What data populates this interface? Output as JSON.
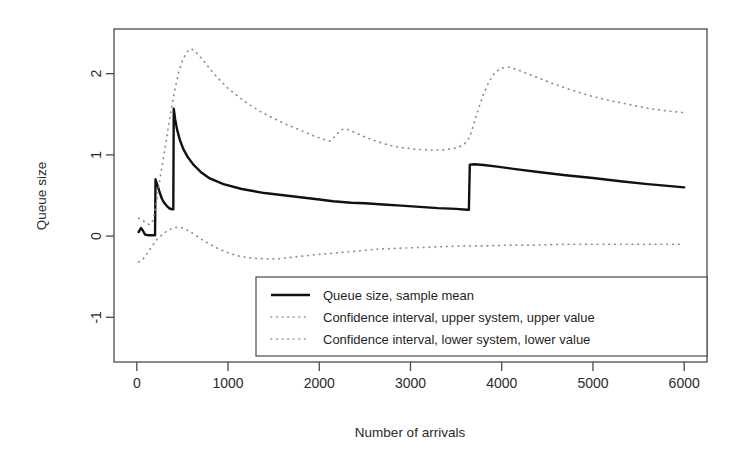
{
  "chart_data": {
    "type": "line",
    "title": "",
    "xlabel": "Number of arrivals",
    "ylabel": "Queue size",
    "xlim": [
      -250,
      6250
    ],
    "ylim": [
      -1.55,
      2.55
    ],
    "xticks": [
      0,
      1000,
      2000,
      3000,
      4000,
      5000,
      6000
    ],
    "xticklabels": [
      "0",
      "1000",
      "2000",
      "3000",
      "4000",
      "5000",
      "6000"
    ],
    "yticks": [
      -1,
      0,
      1,
      2
    ],
    "yticklabels": [
      "-1",
      "0",
      "1",
      "2"
    ],
    "grid": false,
    "legend_position": "bottom-center",
    "series": [
      {
        "name": "Queue size, sample mean",
        "style": "solid",
        "color": "#111111",
        "points": [
          [
            20,
            0.05
          ],
          [
            45,
            0.1
          ],
          [
            60,
            0.08
          ],
          [
            90,
            0.02
          ],
          [
            130,
            0.01
          ],
          [
            180,
            0.01
          ],
          [
            200,
            0.01
          ],
          [
            205,
            0.7
          ],
          [
            225,
            0.63
          ],
          [
            250,
            0.54
          ],
          [
            275,
            0.46
          ],
          [
            300,
            0.41
          ],
          [
            330,
            0.37
          ],
          [
            360,
            0.34
          ],
          [
            390,
            0.33
          ],
          [
            400,
            0.33
          ],
          [
            405,
            1.57
          ],
          [
            420,
            1.44
          ],
          [
            440,
            1.32
          ],
          [
            470,
            1.19
          ],
          [
            510,
            1.07
          ],
          [
            560,
            0.97
          ],
          [
            620,
            0.88
          ],
          [
            700,
            0.79
          ],
          [
            800,
            0.71
          ],
          [
            950,
            0.64
          ],
          [
            1150,
            0.58
          ],
          [
            1400,
            0.53
          ],
          [
            1700,
            0.49
          ],
          [
            2000,
            0.45
          ],
          [
            2150,
            0.43
          ],
          [
            2250,
            0.42
          ],
          [
            2350,
            0.41
          ],
          [
            2500,
            0.405
          ],
          [
            2700,
            0.39
          ],
          [
            2900,
            0.375
          ],
          [
            3100,
            0.36
          ],
          [
            3300,
            0.345
          ],
          [
            3500,
            0.335
          ],
          [
            3620,
            0.325
          ],
          [
            3640,
            0.325
          ],
          [
            3650,
            0.88
          ],
          [
            3700,
            0.885
          ],
          [
            3800,
            0.875
          ],
          [
            3950,
            0.855
          ],
          [
            4150,
            0.825
          ],
          [
            4400,
            0.79
          ],
          [
            4700,
            0.75
          ],
          [
            5000,
            0.715
          ],
          [
            5300,
            0.675
          ],
          [
            5600,
            0.64
          ],
          [
            5850,
            0.615
          ],
          [
            6000,
            0.6
          ]
        ]
      },
      {
        "name": "Confidence interval, upper system, upper value",
        "style": "dotted",
        "color": "#8d8d8d",
        "points": [
          [
            20,
            0.22
          ],
          [
            60,
            0.2
          ],
          [
            100,
            0.16
          ],
          [
            140,
            0.14
          ],
          [
            180,
            0.2
          ],
          [
            220,
            0.45
          ],
          [
            260,
            0.75
          ],
          [
            300,
            1.02
          ],
          [
            340,
            1.3
          ],
          [
            380,
            1.58
          ],
          [
            420,
            1.82
          ],
          [
            460,
            2.02
          ],
          [
            500,
            2.16
          ],
          [
            540,
            2.25
          ],
          [
            575,
            2.3
          ],
          [
            610,
            2.3
          ],
          [
            650,
            2.26
          ],
          [
            700,
            2.2
          ],
          [
            760,
            2.12
          ],
          [
            830,
            2.02
          ],
          [
            910,
            1.92
          ],
          [
            1000,
            1.82
          ],
          [
            1110,
            1.72
          ],
          [
            1230,
            1.62
          ],
          [
            1360,
            1.53
          ],
          [
            1500,
            1.45
          ],
          [
            1650,
            1.37
          ],
          [
            1800,
            1.3
          ],
          [
            1950,
            1.23
          ],
          [
            2050,
            1.19
          ],
          [
            2120,
            1.17
          ],
          [
            2180,
            1.24
          ],
          [
            2230,
            1.3
          ],
          [
            2270,
            1.32
          ],
          [
            2320,
            1.31
          ],
          [
            2400,
            1.27
          ],
          [
            2500,
            1.22
          ],
          [
            2620,
            1.17
          ],
          [
            2760,
            1.12
          ],
          [
            2900,
            1.09
          ],
          [
            3050,
            1.07
          ],
          [
            3200,
            1.06
          ],
          [
            3350,
            1.06
          ],
          [
            3480,
            1.08
          ],
          [
            3580,
            1.12
          ],
          [
            3650,
            1.22
          ],
          [
            3720,
            1.48
          ],
          [
            3790,
            1.72
          ],
          [
            3860,
            1.9
          ],
          [
            3930,
            2.02
          ],
          [
            4000,
            2.07
          ],
          [
            4080,
            2.08
          ],
          [
            4170,
            2.05
          ],
          [
            4280,
            2.0
          ],
          [
            4420,
            1.94
          ],
          [
            4580,
            1.87
          ],
          [
            4760,
            1.8
          ],
          [
            4960,
            1.73
          ],
          [
            5180,
            1.67
          ],
          [
            5400,
            1.62
          ],
          [
            5620,
            1.57
          ],
          [
            5820,
            1.54
          ],
          [
            6000,
            1.52
          ]
        ]
      },
      {
        "name": "Confidence interval, lower system, lower value",
        "style": "dotted",
        "color": "#8d8d8d",
        "points": [
          [
            20,
            -0.32
          ],
          [
            70,
            -0.28
          ],
          [
            120,
            -0.2
          ],
          [
            170,
            -0.12
          ],
          [
            220,
            -0.04
          ],
          [
            280,
            0.02
          ],
          [
            340,
            0.07
          ],
          [
            400,
            0.1
          ],
          [
            450,
            0.11
          ],
          [
            500,
            0.1
          ],
          [
            560,
            0.07
          ],
          [
            630,
            0.02
          ],
          [
            710,
            -0.04
          ],
          [
            800,
            -0.1
          ],
          [
            900,
            -0.16
          ],
          [
            1010,
            -0.21
          ],
          [
            1130,
            -0.25
          ],
          [
            1260,
            -0.27
          ],
          [
            1400,
            -0.28
          ],
          [
            1550,
            -0.28
          ],
          [
            1700,
            -0.26
          ],
          [
            1870,
            -0.24
          ],
          [
            2050,
            -0.22
          ],
          [
            2250,
            -0.2
          ],
          [
            2450,
            -0.18
          ],
          [
            2650,
            -0.16
          ],
          [
            2870,
            -0.15
          ],
          [
            3100,
            -0.14
          ],
          [
            3350,
            -0.13
          ],
          [
            3600,
            -0.12
          ],
          [
            3850,
            -0.12
          ],
          [
            4100,
            -0.11
          ],
          [
            4400,
            -0.11
          ],
          [
            4700,
            -0.1
          ],
          [
            5000,
            -0.1
          ],
          [
            5300,
            -0.1
          ],
          [
            5600,
            -0.1
          ],
          [
            5850,
            -0.1
          ],
          [
            6000,
            -0.1
          ]
        ]
      }
    ]
  },
  "legend": {
    "items": [
      {
        "label": "Queue size, sample mean",
        "style": "solid"
      },
      {
        "label": "Confidence interval, upper system, upper value",
        "style": "dotted"
      },
      {
        "label": "Confidence interval, lower system, lower value",
        "style": "dotted"
      }
    ]
  }
}
